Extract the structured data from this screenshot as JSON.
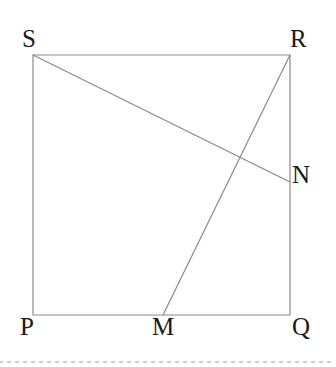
{
  "figure": {
    "background_color": "#ffffff",
    "stroke_color": "#8a8a8a",
    "label_color": "#1a1a1a",
    "stroke_width": 1.2,
    "labels": {
      "S": "S",
      "R": "R",
      "N": "N",
      "P": "P",
      "M": "M",
      "Q": "Q"
    },
    "points": {
      "S": {
        "x": 33,
        "y": 55
      },
      "R": {
        "x": 290,
        "y": 55
      },
      "Q": {
        "x": 290,
        "y": 315
      },
      "P": {
        "x": 33,
        "y": 315
      },
      "N": {
        "x": 290,
        "y": 182
      },
      "M": {
        "x": 163,
        "y": 315
      },
      "intersection": {
        "x": 237,
        "y": 160
      }
    },
    "shapes": {
      "square_points": "33,55 290,55 290,315 33,315",
      "segment_SN": {
        "x1": 33,
        "y1": 55,
        "x2": 290,
        "y2": 182
      },
      "segment_MR": {
        "x1": 163,
        "y1": 315,
        "x2": 290,
        "y2": 55
      }
    },
    "footer_rule": {
      "y": 362,
      "color": "#c8c8c8",
      "dash": "2 6",
      "x1": 0,
      "x2": 336
    }
  }
}
